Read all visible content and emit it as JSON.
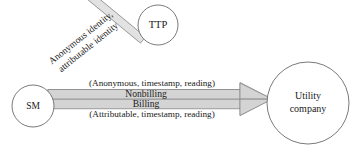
{
  "diagram": {
    "type": "flow-diagram",
    "background_color": "#ffffff",
    "nodes": [
      {
        "id": "sm",
        "label": "SM",
        "shape": "circle"
      },
      {
        "id": "ttp",
        "label": "TTP",
        "shape": "circle"
      },
      {
        "id": "utility",
        "label_line1": "Utility",
        "label_line2": "company",
        "shape": "circle"
      }
    ],
    "edges": {
      "ttp_to_sm": {
        "from": "ttp",
        "to": "sm",
        "style": "block-arrow-hollow-head",
        "label_line1": "Anonymous identity,",
        "label_line2": "attributable identity",
        "fill_color": "#e2e2e2",
        "stroke_color": "#8a8a8a"
      },
      "nonbilling": {
        "from": "sm",
        "to": "utility",
        "style": "block-arrow",
        "label_above": "(Anonymous, timestamp, reading)",
        "label_inside": "Nonbilling",
        "fill_color": "#d4d4d4",
        "stroke_color": "#8a8a8a"
      },
      "billing": {
        "from": "sm",
        "to": "utility",
        "style": "block-arrow",
        "label_inside": "Billing",
        "label_below": "(Attributable, timestamp, reading)",
        "fill_color": "#d4d4d4",
        "stroke_color": "#8a8a8a"
      }
    }
  }
}
